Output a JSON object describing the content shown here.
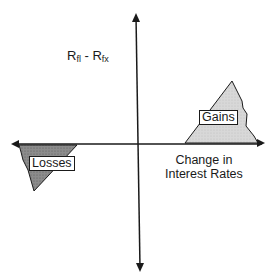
{
  "diagram": {
    "y_axis_label": {
      "main1": "R",
      "sub1": "fl",
      "sep": " - ",
      "main2": "R",
      "sub2": "fx"
    },
    "x_axis_label": {
      "line1": "Change in",
      "line2": "Interest Rates"
    },
    "regions": [
      {
        "label": "Gains",
        "quadrant": "upper-right",
        "fill": "#d4d4d4"
      },
      {
        "label": "Losses",
        "quadrant": "lower-left",
        "fill": "#8a8a8a"
      }
    ],
    "colors": {
      "axis": "#1a1a1a",
      "gains_fill": "#d4d4d4",
      "losses_fill": "#8a8a8a"
    }
  }
}
